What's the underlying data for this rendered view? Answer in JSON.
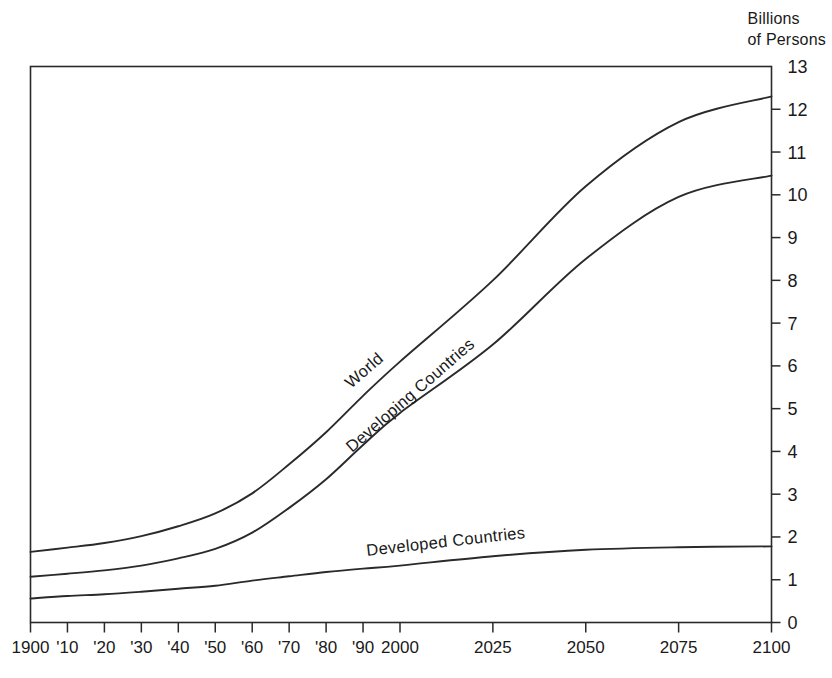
{
  "chart_data": {
    "type": "line",
    "title": "",
    "subtitle": "",
    "ylabel": "Billions of Persons",
    "xlabel": "",
    "ylim": [
      0,
      13
    ],
    "grid": false,
    "legend_position": "inline-curve-labels",
    "y_ticks": [
      "0",
      "1",
      "2",
      "3",
      "4",
      "5",
      "6",
      "7",
      "8",
      "9",
      "10",
      "11",
      "12",
      "13"
    ],
    "y_tick_values": [
      0,
      1,
      2,
      3,
      4,
      5,
      6,
      7,
      8,
      9,
      10,
      11,
      12,
      13
    ],
    "x_ticks": [
      "1900",
      "'10",
      "'20",
      "'30",
      "'40",
      "'50",
      "'60",
      "'70",
      "'80",
      "'90",
      "2000",
      "2025",
      "2050",
      "2075",
      "2100"
    ],
    "x_tick_values": [
      1900,
      1910,
      1920,
      1930,
      1940,
      1950,
      1960,
      1970,
      1980,
      1990,
      2000,
      2025,
      2050,
      2075,
      2100
    ],
    "x_axis_note": "Scale compresses after 2000: decades 1900-2000 then quarter-centuries 2000-2100",
    "series": [
      {
        "name": "World",
        "label": "World",
        "x": [
          1900,
          1910,
          1920,
          1930,
          1940,
          1950,
          1960,
          1970,
          1980,
          1990,
          2000,
          2025,
          2050,
          2075,
          2100
        ],
        "values": [
          1.65,
          1.75,
          1.86,
          2.02,
          2.25,
          2.55,
          3.02,
          3.7,
          4.45,
          5.3,
          6.1,
          8.0,
          10.2,
          11.7,
          12.3
        ]
      },
      {
        "name": "Developing Countries",
        "label": "Developing Countries",
        "x": [
          1900,
          1910,
          1920,
          1930,
          1940,
          1950,
          1960,
          1970,
          1980,
          1990,
          2000,
          2025,
          2050,
          2075,
          2100
        ],
        "values": [
          1.07,
          1.14,
          1.22,
          1.33,
          1.5,
          1.72,
          2.1,
          2.68,
          3.35,
          4.15,
          4.9,
          6.5,
          8.5,
          9.95,
          10.45
        ]
      },
      {
        "name": "Developed Countries",
        "label": "Developed Countries",
        "x": [
          1900,
          1910,
          1920,
          1930,
          1940,
          1950,
          1960,
          1970,
          1980,
          1990,
          2000,
          2025,
          2050,
          2075,
          2100
        ],
        "values": [
          0.56,
          0.62,
          0.66,
          0.72,
          0.79,
          0.86,
          0.98,
          1.08,
          1.18,
          1.26,
          1.33,
          1.55,
          1.7,
          1.76,
          1.78
        ]
      }
    ]
  },
  "axis": {
    "title_line1": "Billions",
    "title_line2": "of Persons",
    "title_full": "Billions\nof Persons"
  },
  "labels": {
    "world": "World",
    "developing": "Developing Countries",
    "developed": "Developed Countries"
  },
  "y_ticks": [
    {
      "label": "13"
    },
    {
      "label": "12"
    },
    {
      "label": "11"
    },
    {
      "label": "10"
    },
    {
      "label": "9"
    },
    {
      "label": "8"
    },
    {
      "label": "7"
    },
    {
      "label": "6"
    },
    {
      "label": "5"
    },
    {
      "label": "4"
    },
    {
      "label": "3"
    },
    {
      "label": "2"
    },
    {
      "label": "1"
    },
    {
      "label": "0"
    }
  ],
  "x_ticks": [
    {
      "label": "1900"
    },
    {
      "label": "'10"
    },
    {
      "label": "'20"
    },
    {
      "label": "'30"
    },
    {
      "label": "'40"
    },
    {
      "label": "'50"
    },
    {
      "label": "'60"
    },
    {
      "label": "'70"
    },
    {
      "label": "'80"
    },
    {
      "label": "'90"
    },
    {
      "label": "2000"
    },
    {
      "label": "2025"
    },
    {
      "label": "2050"
    },
    {
      "label": "2075"
    },
    {
      "label": "2100"
    }
  ],
  "colors": {
    "line": "#2a2a2a",
    "axis": "#2a2a2a",
    "background": "#ffffff"
  }
}
